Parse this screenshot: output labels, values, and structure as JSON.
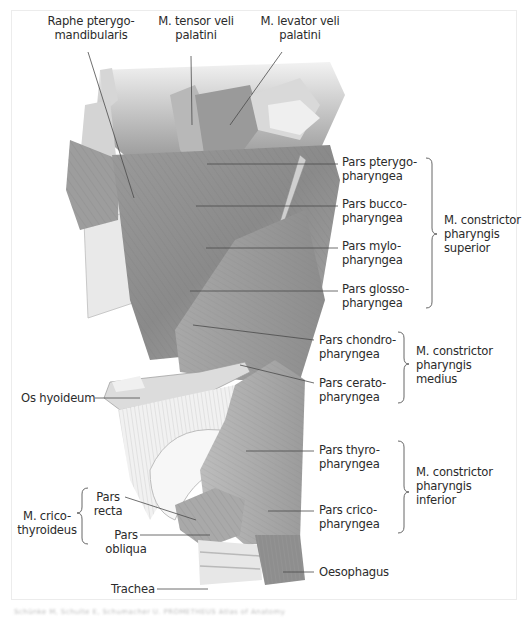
{
  "figure": {
    "top_labels": [
      {
        "id": "raphe",
        "text": "Raphe pterygo-\nmandibularis"
      },
      {
        "id": "tensor",
        "text": "M. tensor veli\npalatini"
      },
      {
        "id": "levator",
        "text": "M. levator veli\npalatini"
      }
    ],
    "right_labels": [
      {
        "id": "pterygo",
        "text": "Pars pterygo-\npharyngea"
      },
      {
        "id": "bucco",
        "text": "Pars bucco-\npharyngea"
      },
      {
        "id": "mylo",
        "text": "Pars mylo-\npharyngea"
      },
      {
        "id": "glosso",
        "text": "Pars glosso-\npharyngea"
      },
      {
        "id": "chondro",
        "text": "Pars chondro-\npharyngea"
      },
      {
        "id": "cerato",
        "text": "Pars cerato-\npharyngea"
      },
      {
        "id": "thyro",
        "text": "Pars thyro-\npharyngea"
      },
      {
        "id": "crico",
        "text": "Pars crico-\npharyngea"
      },
      {
        "id": "oesophagus",
        "text": "Oesophagus"
      }
    ],
    "groups": [
      {
        "id": "superior",
        "text": "M. constrictor\npharyngis\nsuperior"
      },
      {
        "id": "medius",
        "text": "M. constrictor\npharyngis\nmedius"
      },
      {
        "id": "inferior",
        "text": "M. constrictor\npharyngis\ninferior"
      }
    ],
    "left_labels": [
      {
        "id": "hyoid",
        "text": "Os hyoideum"
      },
      {
        "id": "cricothyroid",
        "text": "M. crico-\nthyroideus"
      },
      {
        "id": "recta",
        "text": "Pars\nrecta"
      },
      {
        "id": "obliqua",
        "text": "Pars\nobliqua"
      },
      {
        "id": "trachea",
        "text": "Trachea"
      }
    ],
    "caption": "Schünke M, Schulte E, Schumacher U. PROMETHEUS Atlas of Anatomy"
  },
  "colors": {
    "muscle_dark": "#7f7f7f",
    "muscle_mid": "#a3a3a3",
    "muscle_light": "#c9c9c9",
    "bone": "#e4e4e4",
    "leader_line": "#4a4a4a",
    "text": "#2b2b2b",
    "frame": "#ececec"
  }
}
